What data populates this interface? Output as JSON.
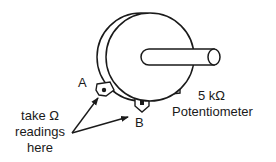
{
  "diagram": {
    "title": "5 kΩ Potentiometer",
    "component": {
      "value_label": "5 kΩ",
      "name_label": "Potentiometer"
    },
    "terminals": [
      {
        "id": "A",
        "label": "A"
      },
      {
        "id": "B",
        "label": "B"
      }
    ],
    "annotation": {
      "line1": "take Ω",
      "line2": "readings",
      "line3": "here"
    },
    "colors": {
      "stroke": "#1a1a1a",
      "background": "#ffffff"
    }
  }
}
